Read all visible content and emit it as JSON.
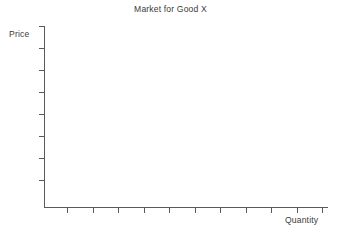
{
  "chart_data": {
    "type": "line",
    "title": "Market for Good X",
    "subtitle": "",
    "xlabel": "Quantity",
    "ylabel": "Price",
    "series": [],
    "categories": [],
    "values": [],
    "annotations": [],
    "legend": null,
    "legend_position": "none",
    "grid": false,
    "xlim": [
      0,
      11
    ],
    "ylim": [
      0,
      8
    ],
    "x_tick_labels": [],
    "y_tick_labels": [],
    "x_tick_count": 11,
    "y_tick_count": 8
  },
  "chart": {
    "title": "Market for Good X",
    "y_axis": {
      "label": "Price",
      "tick_positions_px": [
        0,
        22,
        44,
        66,
        88,
        110,
        132,
        154
      ],
      "axis_top_px": 26,
      "axis_bottom_px": 207
    },
    "x_axis": {
      "label": "Quantity",
      "tick_positions_px": [
        23,
        48.5,
        74,
        99.5,
        125,
        150.5,
        176,
        201.5,
        227,
        252.5,
        278
      ],
      "axis_left_px": 44,
      "axis_right_px": 327
    }
  },
  "colors": {
    "background": "#ffffff",
    "axis": "#5a5a5a",
    "text": "#3b3b3b"
  }
}
